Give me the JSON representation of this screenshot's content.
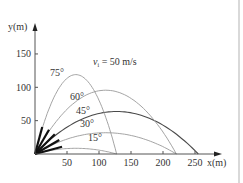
{
  "chart_data": {
    "type": "line",
    "title": "",
    "annotation": "v_i = 50 m/s",
    "xlabel": "x(m)",
    "ylabel": "y(m)",
    "xticks": [
      50,
      100,
      150,
      200,
      250
    ],
    "yticks": [
      50,
      100,
      150
    ],
    "xlim": [
      0,
      270
    ],
    "ylim": [
      0,
      160
    ],
    "grid": false,
    "initial_speed": 50,
    "g": 9.8,
    "series": [
      {
        "name": "15°",
        "angle": 15,
        "range": 127.6,
        "max_height": 8.5,
        "color": "#9a9a9a"
      },
      {
        "name": "30°",
        "angle": 30,
        "range": 221,
        "max_height": 31.9,
        "color": "#9a9a9a"
      },
      {
        "name": "45°",
        "angle": 45,
        "range": 255,
        "max_height": 63.8,
        "color": "#4a4a4a"
      },
      {
        "name": "60°",
        "angle": 60,
        "range": 221,
        "max_height": 95.7,
        "color": "#9a9a9a"
      },
      {
        "name": "75°",
        "angle": 75,
        "range": 127.6,
        "max_height": 119.6,
        "color": "#9a9a9a"
      }
    ]
  },
  "labels": {
    "annotation": "v",
    "annotation_sub": "i",
    "annotation_rest": " = 50 m/s",
    "x_axis": "x(m)",
    "y_axis": "y(m)"
  },
  "colors": {
    "axis": "#555555",
    "curve": "#9a9a9a",
    "curve_highlight": "#4a4a4a",
    "arrow": "#111111"
  }
}
